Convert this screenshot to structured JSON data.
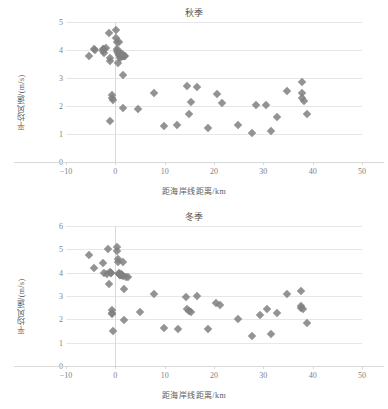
{
  "figure": {
    "width": 388,
    "height": 409,
    "background": "#ffffff",
    "marker_color": "#808080",
    "grid_color": "#e4e8ec",
    "text_color": "#595959"
  },
  "chart_data": [
    {
      "type": "scatter",
      "title": "秋季",
      "xlabel": "距海岸线距离/km",
      "ylabel": "平均风速/(m/s)",
      "xlim": [
        -10,
        50
      ],
      "ylim": [
        0,
        5
      ],
      "xticks": [
        -10,
        0,
        10,
        20,
        30,
        40,
        50
      ],
      "yticks": [
        0,
        1,
        2,
        3,
        4,
        5
      ],
      "grid": true,
      "legend": "none",
      "marker": "diamond",
      "marker_color": "#808080",
      "points": [
        {
          "x": -5.4,
          "y": 3.78
        },
        {
          "x": -4.4,
          "y": 4.05
        },
        {
          "x": -4.1,
          "y": 4.0
        },
        {
          "x": -2.5,
          "y": 4.02
        },
        {
          "x": -2.4,
          "y": 3.95
        },
        {
          "x": -2.3,
          "y": 3.9
        },
        {
          "x": -2.2,
          "y": 4.05
        },
        {
          "x": -1.8,
          "y": 4.07
        },
        {
          "x": -1.2,
          "y": 4.62
        },
        {
          "x": -1.1,
          "y": 3.72
        },
        {
          "x": -1.0,
          "y": 3.6
        },
        {
          "x": -1.0,
          "y": 1.48
        },
        {
          "x": -0.6,
          "y": 2.4
        },
        {
          "x": -0.6,
          "y": 2.28
        },
        {
          "x": -0.5,
          "y": 2.22
        },
        {
          "x": 0.1,
          "y": 4.7
        },
        {
          "x": 0.2,
          "y": 4.42
        },
        {
          "x": 0.3,
          "y": 4.28
        },
        {
          "x": 0.3,
          "y": 4.05
        },
        {
          "x": 0.4,
          "y": 3.95
        },
        {
          "x": 0.5,
          "y": 3.9
        },
        {
          "x": 0.5,
          "y": 3.55
        },
        {
          "x": 0.7,
          "y": 4.3
        },
        {
          "x": 0.8,
          "y": 3.82
        },
        {
          "x": 0.9,
          "y": 3.78
        },
        {
          "x": 1.0,
          "y": 3.72
        },
        {
          "x": 1.1,
          "y": 3.88
        },
        {
          "x": 1.2,
          "y": 3.85
        },
        {
          "x": 1.3,
          "y": 3.8
        },
        {
          "x": 1.4,
          "y": 3.78
        },
        {
          "x": 1.5,
          "y": 3.8
        },
        {
          "x": 1.6,
          "y": 3.82
        },
        {
          "x": 1.7,
          "y": 3.8
        },
        {
          "x": 1.8,
          "y": 3.78
        },
        {
          "x": 1.5,
          "y": 3.12
        },
        {
          "x": 1.6,
          "y": 1.92
        },
        {
          "x": 2.0,
          "y": 3.8
        },
        {
          "x": 4.6,
          "y": 1.9
        },
        {
          "x": 7.8,
          "y": 2.45
        },
        {
          "x": 9.8,
          "y": 1.27
        },
        {
          "x": 12.6,
          "y": 1.33
        },
        {
          "x": 14.6,
          "y": 2.72
        },
        {
          "x": 14.9,
          "y": 1.71
        },
        {
          "x": 15.3,
          "y": 2.14
        },
        {
          "x": 16.6,
          "y": 2.68
        },
        {
          "x": 18.7,
          "y": 1.2
        },
        {
          "x": 20.7,
          "y": 2.42
        },
        {
          "x": 21.7,
          "y": 2.1
        },
        {
          "x": 24.8,
          "y": 1.31
        },
        {
          "x": 27.8,
          "y": 1.03
        },
        {
          "x": 28.6,
          "y": 2.05
        },
        {
          "x": 30.6,
          "y": 2.03
        },
        {
          "x": 31.6,
          "y": 1.09
        },
        {
          "x": 32.8,
          "y": 1.62
        },
        {
          "x": 34.8,
          "y": 2.55
        },
        {
          "x": 37.8,
          "y": 2.85
        },
        {
          "x": 37.8,
          "y": 2.48
        },
        {
          "x": 37.9,
          "y": 2.3
        },
        {
          "x": 38.3,
          "y": 2.18
        },
        {
          "x": 38.9,
          "y": 1.73
        }
      ]
    },
    {
      "type": "scatter",
      "title": "冬季",
      "xlabel": "距海岸线距离/km",
      "ylabel": "平均风速/(m/s)",
      "xlim": [
        -10,
        50
      ],
      "ylim": [
        0,
        6
      ],
      "xticks": [
        -10,
        0,
        10,
        20,
        30,
        40,
        50
      ],
      "yticks": [
        0,
        1,
        2,
        3,
        4,
        5,
        6
      ],
      "grid": true,
      "legend": "none",
      "marker": "diamond",
      "marker_color": "#808080",
      "points": [
        {
          "x": -5.4,
          "y": 4.75
        },
        {
          "x": -4.4,
          "y": 4.2
        },
        {
          "x": -2.4,
          "y": 4.42
        },
        {
          "x": -2.3,
          "y": 4.0
        },
        {
          "x": -1.6,
          "y": 3.95
        },
        {
          "x": -1.4,
          "y": 5.0
        },
        {
          "x": -1.2,
          "y": 3.5
        },
        {
          "x": -1.1,
          "y": 4.05
        },
        {
          "x": -0.9,
          "y": 4.0
        },
        {
          "x": -0.8,
          "y": 3.98
        },
        {
          "x": -0.7,
          "y": 2.4
        },
        {
          "x": -0.7,
          "y": 2.28
        },
        {
          "x": -0.6,
          "y": 2.25
        },
        {
          "x": -0.5,
          "y": 1.48
        },
        {
          "x": 0.3,
          "y": 5.1
        },
        {
          "x": 0.4,
          "y": 4.95
        },
        {
          "x": 0.5,
          "y": 4.6
        },
        {
          "x": 0.6,
          "y": 4.45
        },
        {
          "x": 0.7,
          "y": 4.0
        },
        {
          "x": 0.8,
          "y": 3.95
        },
        {
          "x": 0.9,
          "y": 3.92
        },
        {
          "x": 1.0,
          "y": 3.9
        },
        {
          "x": 1.1,
          "y": 3.95
        },
        {
          "x": 1.2,
          "y": 3.9
        },
        {
          "x": 1.3,
          "y": 3.88
        },
        {
          "x": 1.4,
          "y": 3.9
        },
        {
          "x": 1.5,
          "y": 4.45
        },
        {
          "x": 1.6,
          "y": 3.85
        },
        {
          "x": 1.7,
          "y": 3.32
        },
        {
          "x": 1.8,
          "y": 1.98
        },
        {
          "x": 2.2,
          "y": 3.82
        },
        {
          "x": 2.5,
          "y": 3.8
        },
        {
          "x": 4.9,
          "y": 2.32
        },
        {
          "x": 7.9,
          "y": 3.08
        },
        {
          "x": 9.9,
          "y": 1.62
        },
        {
          "x": 12.7,
          "y": 1.58
        },
        {
          "x": 14.4,
          "y": 2.95
        },
        {
          "x": 14.5,
          "y": 2.45
        },
        {
          "x": 14.9,
          "y": 2.35
        },
        {
          "x": 15.3,
          "y": 2.3
        },
        {
          "x": 16.6,
          "y": 3.0
        },
        {
          "x": 18.7,
          "y": 1.57
        },
        {
          "x": 20.5,
          "y": 2.68
        },
        {
          "x": 21.3,
          "y": 2.62
        },
        {
          "x": 24.8,
          "y": 2.0
        },
        {
          "x": 27.7,
          "y": 1.28
        },
        {
          "x": 29.4,
          "y": 2.2
        },
        {
          "x": 30.8,
          "y": 2.45
        },
        {
          "x": 31.6,
          "y": 1.38
        },
        {
          "x": 32.7,
          "y": 2.28
        },
        {
          "x": 34.8,
          "y": 3.08
        },
        {
          "x": 37.6,
          "y": 3.2
        },
        {
          "x": 37.6,
          "y": 2.58
        },
        {
          "x": 37.7,
          "y": 2.5
        },
        {
          "x": 38.1,
          "y": 2.45
        },
        {
          "x": 38.8,
          "y": 1.85
        }
      ]
    }
  ]
}
